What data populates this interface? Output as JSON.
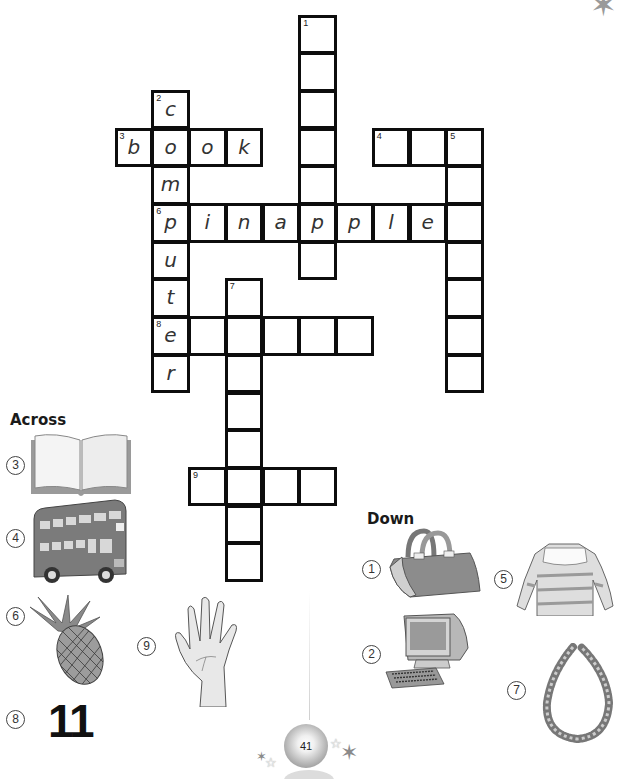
{
  "crossword": {
    "cell_w": 36.75,
    "cell_h": 37.7,
    "origin_x": 116,
    "origin_y": 16,
    "words": [
      {
        "number": 1,
        "direction": "down",
        "row": 0,
        "col": 5,
        "length": 7,
        "filled": ""
      },
      {
        "number": 2,
        "direction": "down",
        "row": 2,
        "col": 1,
        "length": 8,
        "filled": "computer"
      },
      {
        "number": 3,
        "direction": "across",
        "row": 3,
        "col": 0,
        "length": 4,
        "filled": "book"
      },
      {
        "number": 4,
        "direction": "across",
        "row": 3,
        "col": 7,
        "length": 3,
        "filled": ""
      },
      {
        "number": 5,
        "direction": "down",
        "row": 3,
        "col": 9,
        "length": 7,
        "filled": ""
      },
      {
        "number": 6,
        "direction": "across",
        "row": 5,
        "col": 1,
        "length": 9,
        "filled": "pinapple"
      },
      {
        "number": 7,
        "direction": "down",
        "row": 7,
        "col": 3,
        "length": 8,
        "filled": ""
      },
      {
        "number": 8,
        "direction": "across",
        "row": 8,
        "col": 1,
        "length": 6,
        "filled": "e"
      },
      {
        "number": 9,
        "direction": "across",
        "row": 12,
        "col": 2,
        "length": 4,
        "filled": ""
      }
    ]
  },
  "across": {
    "title": "Across",
    "clues": [
      {
        "number": "3",
        "picture": "open-book"
      },
      {
        "number": "4",
        "picture": "double-decker-bus"
      },
      {
        "number": "6",
        "picture": "pineapple"
      },
      {
        "number": "8",
        "picture": "number",
        "text": "11"
      },
      {
        "number": "9",
        "picture": "hand"
      }
    ]
  },
  "down": {
    "title": "Down",
    "clues": [
      {
        "number": "1",
        "picture": "handbag"
      },
      {
        "number": "2",
        "picture": "computer"
      },
      {
        "number": "5",
        "picture": "sweater"
      },
      {
        "number": "7",
        "picture": "necklace"
      }
    ]
  },
  "footer": {
    "page_number": "41"
  }
}
